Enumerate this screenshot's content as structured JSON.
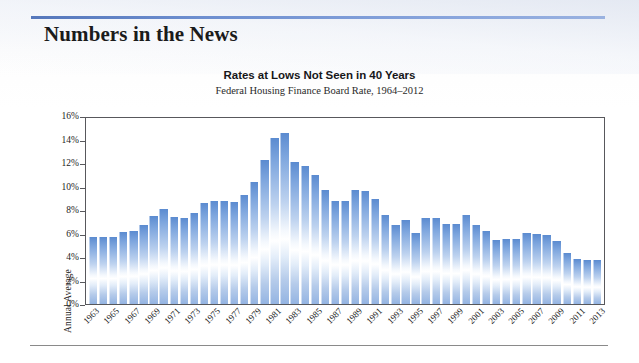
{
  "page": {
    "section_title": "Numbers in the News",
    "accent_color": "#6e8fd0",
    "rule_color": "#8a8a8a"
  },
  "chart_data": {
    "type": "bar",
    "title": "Rates at Lows Not Seen in 40 Years",
    "subtitle": "Federal Housing Finance Board Rate, 1964–2012",
    "xlabel": "",
    "ylabel": "Annual Average",
    "ylim": [
      0,
      16
    ],
    "ytick_labels": [
      "0%",
      "2%",
      "4%",
      "6%",
      "8%",
      "10%",
      "12%",
      "14%",
      "16%"
    ],
    "ytick_values": [
      0,
      2,
      4,
      6,
      8,
      10,
      12,
      14,
      16
    ],
    "grid": false,
    "legend": null,
    "bar_color": "#6f9ad8",
    "categories": [
      "1963",
      "1964",
      "1965",
      "1966",
      "1967",
      "1968",
      "1969",
      "1970",
      "1971",
      "1972",
      "1973",
      "1974",
      "1975",
      "1976",
      "1977",
      "1978",
      "1979",
      "1980",
      "1981",
      "1982",
      "1983",
      "1984",
      "1985",
      "1986",
      "1987",
      "1988",
      "1989",
      "1990",
      "1991",
      "1992",
      "1993",
      "1994",
      "1995",
      "1996",
      "1997",
      "1998",
      "1999",
      "2000",
      "2001",
      "2002",
      "2003",
      "2004",
      "2005",
      "2006",
      "2007",
      "2008",
      "2009",
      "2010",
      "2011",
      "2012",
      "2013"
    ],
    "values": [
      5.8,
      5.8,
      5.8,
      6.2,
      6.3,
      6.8,
      7.6,
      8.2,
      7.5,
      7.4,
      7.8,
      8.7,
      8.9,
      8.9,
      8.8,
      9.4,
      10.5,
      12.4,
      14.3,
      14.7,
      12.2,
      11.9,
      11.1,
      9.8,
      8.9,
      8.9,
      9.8,
      9.7,
      9.0,
      7.7,
      6.8,
      7.2,
      6.1,
      7.4,
      7.4,
      6.9,
      6.9,
      7.7,
      6.8,
      6.3,
      5.5,
      5.6,
      5.6,
      6.1,
      6.0,
      5.9,
      5.4,
      4.4,
      3.9,
      3.8,
      3.8
    ],
    "xtick_labels": [
      "1963",
      "1965",
      "1967",
      "1969",
      "1971",
      "1973",
      "1975",
      "1977",
      "1979",
      "1981",
      "1983",
      "1985",
      "1987",
      "1989",
      "1991",
      "1993",
      "1995",
      "1997",
      "1999",
      "2001",
      "2003",
      "2005",
      "2007",
      "2009",
      "2011",
      "2013"
    ]
  }
}
